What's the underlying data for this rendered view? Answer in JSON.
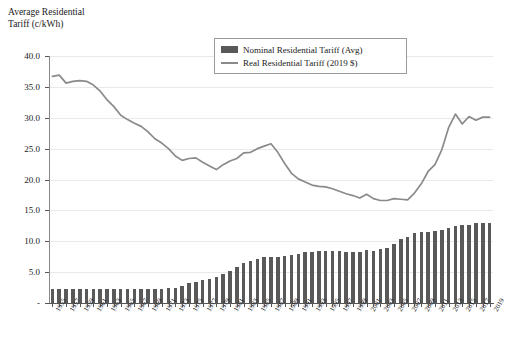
{
  "chart_data": {
    "type": "bar",
    "title": "",
    "ylabel": "Average Residential\nTariff (c/kWh)",
    "xlabel": "",
    "ylim": [
      0,
      40
    ],
    "ytick_labels": [
      "40.0",
      "35.0",
      "30.0",
      "25.0",
      "20.0",
      "15.0",
      "10.0",
      "5.0",
      "-"
    ],
    "ytick_values": [
      40,
      35,
      30,
      25,
      20,
      15,
      10,
      5,
      0
    ],
    "grid": true,
    "legend_position": "top-center",
    "x_label_step": 2,
    "categories": [
      "1955",
      "1956",
      "1957",
      "1958",
      "1959",
      "1960",
      "1961",
      "1962",
      "1963",
      "1964",
      "1965",
      "1966",
      "1967",
      "1968",
      "1969",
      "1970",
      "1971",
      "1972",
      "1973",
      "1974",
      "1975",
      "1976",
      "1977",
      "1978",
      "1979",
      "1980",
      "1981",
      "1982",
      "1983",
      "1984",
      "1985",
      "1986",
      "1987",
      "1988",
      "1989",
      "1990",
      "1991",
      "1992",
      "1993",
      "1994",
      "1995",
      "1996",
      "1997",
      "1998",
      "1999",
      "2000",
      "2001",
      "2002",
      "2003",
      "2004",
      "2005",
      "2006",
      "2007",
      "2008",
      "2009",
      "2010",
      "2011",
      "2012",
      "2013",
      "2014",
      "2015",
      "2016",
      "2017",
      "2018",
      "2019"
    ],
    "series": [
      {
        "name": "Nominal Residential Tariff (Avg)",
        "type": "bar",
        "color": "#595959",
        "values": [
          2.3,
          2.3,
          2.3,
          2.3,
          2.3,
          2.3,
          2.3,
          2.2,
          2.2,
          2.2,
          2.2,
          2.2,
          2.2,
          2.2,
          2.2,
          2.2,
          2.3,
          2.4,
          2.5,
          2.8,
          3.2,
          3.4,
          3.7,
          3.9,
          4.2,
          4.7,
          5.2,
          5.8,
          6.4,
          6.8,
          7.2,
          7.4,
          7.5,
          7.5,
          7.6,
          7.8,
          8.0,
          8.2,
          8.3,
          8.4,
          8.4,
          8.4,
          8.4,
          8.3,
          8.2,
          8.2,
          8.6,
          8.4,
          8.7,
          8.9,
          9.5,
          10.4,
          10.7,
          11.3,
          11.5,
          11.5,
          11.7,
          11.9,
          12.1,
          12.5,
          12.6,
          12.6,
          12.9,
          12.9,
          13.0
        ]
      },
      {
        "name": "Real Residential Tariff (2019 $)",
        "type": "line",
        "color": "#8a8a8a",
        "values": [
          36.7,
          36.9,
          35.6,
          35.9,
          36.0,
          35.9,
          35.3,
          34.3,
          32.9,
          31.8,
          30.4,
          29.7,
          29.1,
          28.6,
          27.7,
          26.6,
          25.9,
          25.0,
          23.8,
          23.1,
          23.4,
          23.5,
          22.8,
          22.2,
          21.6,
          22.4,
          23.0,
          23.4,
          24.3,
          24.4,
          25.0,
          25.4,
          25.8,
          24.4,
          22.6,
          21.0,
          20.1,
          19.6,
          19.1,
          18.9,
          18.8,
          18.5,
          18.1,
          17.7,
          17.4,
          17.0,
          17.6,
          16.9,
          16.6,
          16.6,
          16.9,
          16.8,
          16.7,
          17.8,
          19.3,
          21.3,
          22.4,
          24.8,
          28.4,
          30.6,
          29.0,
          30.2,
          29.6,
          30.1,
          30.1
        ]
      }
    ]
  },
  "legend": {
    "items": [
      {
        "label": "Nominal Residential Tariff (Avg)",
        "marker": "bar"
      },
      {
        "label": "Real Residential Tariff (2019 $)",
        "marker": "line"
      }
    ]
  }
}
